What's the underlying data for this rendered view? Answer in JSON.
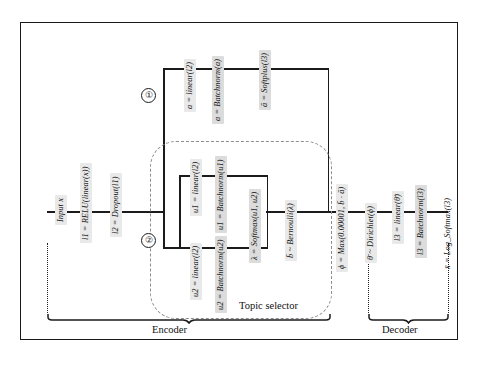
{
  "diagram": {
    "sections": {
      "encoder_label": "Encoder",
      "decoder_label": "Decoder",
      "topic_selector_label": "Topic selector"
    },
    "markers": {
      "branch_one": "①",
      "branch_two": "②"
    },
    "nodes": {
      "input": "Input x",
      "l1": "l1 = RELU(linear(x))",
      "l2": "l2 = Dropout(l1)",
      "a_linear": "a = linear(l2)",
      "a_batchnorm": "a = Batchnorm(a)",
      "a_softplus": "ā = Softplus(l3)",
      "u1_linear": "u1 = linear(l2)",
      "u1_batchnorm": "u1 = Batchnorm(u1)",
      "u2_linear": "u2 = linear(l2)",
      "u2_batchnorm": "u2 = Batchnorm(u2)",
      "lambda_softmax": "λ = Softmax(u1, u2)",
      "b_bernoulli": "b̄ ~ Bernoulli(λ)",
      "phi_max": "ϕ = Max(0.00001, b̄ · ā)",
      "theta_dirichlet": "θ̄ ~ Dirichlet(ϕ)",
      "l3_linear": "l3 = linear(θ̄)",
      "l3_batchnorm": "l3 = Batchnorm(l3)",
      "x_logsoftmax": "x̄ = Log_Softmax(l3)"
    },
    "colors": {
      "line": "#1b1b1b",
      "label_bg": "#e9e9e9",
      "label_bg_dark": "#dcdcdc",
      "dashed": "#8e8e8e",
      "frame": "#1a1a1a"
    }
  }
}
